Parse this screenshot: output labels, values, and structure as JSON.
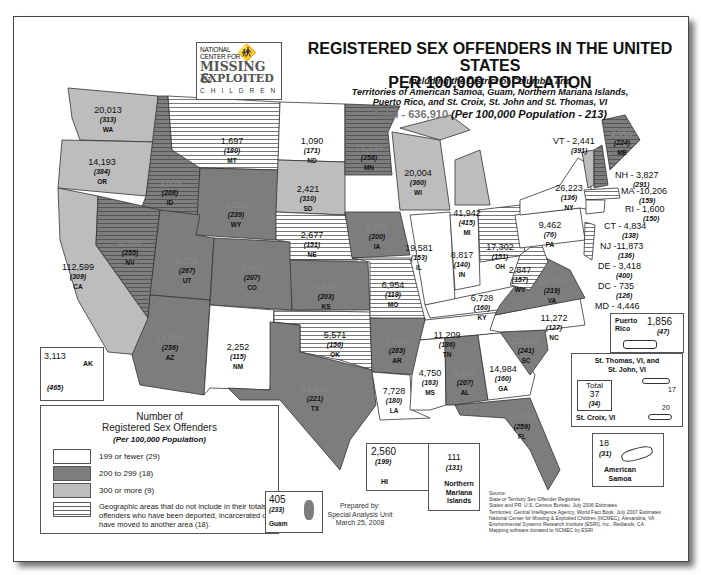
{
  "logo": {
    "line1": "NATIONAL",
    "line2": "CENTER FOR",
    "missing": "MISSING &",
    "exploited": "EXPLOITED",
    "children": "CHILDREN",
    "icon": "running-children-icon"
  },
  "header": {
    "title_line1": "REGISTERED SEX OFFENDERS IN THE UNITED STATES",
    "title_line2": "PER 100,000 POPULATION",
    "subtitle_line1": "Including the District of Columbia and",
    "subtitle_line2": "Territories of American Samoa, Guam, Northern Mariana Islands,",
    "subtitle_line3": "Puerto Rico, and St. Croix, St. John and St. Thomas, VI",
    "total_label": "Total - 636,910",
    "total_rate": "(Per 100,000 Population - 213)"
  },
  "colors": {
    "low": "#ffffff",
    "mid": "#7d7d7d",
    "high": "#bdbdbd",
    "hatch_line": "#666666",
    "border": "#444444"
  },
  "states": {
    "WA": {
      "count": "20,013",
      "rate": "(313)",
      "code": "WA"
    },
    "OR": {
      "count": "14,193",
      "rate": "(384)",
      "code": "OR"
    },
    "CA": {
      "count": "112,599",
      "rate": "(309)",
      "code": "CA"
    },
    "ID": {
      "count": "3,059",
      "rate": "(208)",
      "code": "ID"
    },
    "NV": {
      "count": "6,366",
      "rate": "(255)",
      "code": "NV"
    },
    "MT": {
      "count": "1,697",
      "rate": "(180)",
      "code": "MT"
    },
    "WY": {
      "count": "1,229",
      "rate": "(239)",
      "code": "WY"
    },
    "UT": {
      "count": "6,796",
      "rate": "(267)",
      "code": "UT"
    },
    "AZ": {
      "count": "14,559",
      "rate": "(236)",
      "code": "AZ"
    },
    "CO": {
      "count": "9,860",
      "rate": "(207)",
      "code": "CO"
    },
    "NM": {
      "count": "2,252",
      "rate": "(115)",
      "code": "NM"
    },
    "ND": {
      "count": "1,090",
      "rate": "(171)",
      "code": "ND"
    },
    "SD": {
      "count": "2,421",
      "rate": "(310)",
      "code": "SD"
    },
    "NE": {
      "count": "2,677",
      "rate": "(151)",
      "code": "NE"
    },
    "KS": {
      "count": "5,665",
      "rate": "(203)",
      "code": "KS"
    },
    "OK": {
      "count": "5,571",
      "rate": "(156)",
      "code": "OK"
    },
    "TX": {
      "count": "51,898",
      "rate": "(221)",
      "code": "TX"
    },
    "MN": {
      "count": "13,349",
      "rate": "(258)",
      "code": "MN"
    },
    "IA": {
      "count": "5,951",
      "rate": "(200)",
      "code": "IA"
    },
    "MO": {
      "count": "6,954",
      "rate": "(119)",
      "code": "MO"
    },
    "AR": {
      "count": "7,959",
      "rate": "(283)",
      "code": "AR"
    },
    "LA": {
      "count": "7,728",
      "rate": "(180)",
      "code": "LA"
    },
    "WI": {
      "count": "20,004",
      "rate": "(360)",
      "code": "WI"
    },
    "IL": {
      "count": "19,581",
      "rate": "(153)",
      "code": "IL"
    },
    "MI": {
      "count": "41,942",
      "rate": "(415)",
      "code": "MI"
    },
    "IN": {
      "count": "8,817",
      "rate": "(140)",
      "code": "IN"
    },
    "OH": {
      "count": "17,302",
      "rate": "(151)",
      "code": "OH"
    },
    "KY": {
      "count": "6,728",
      "rate": "(160)",
      "code": "KY"
    },
    "TN": {
      "count": "11,209",
      "rate": "(186)",
      "code": "TN"
    },
    "MS": {
      "count": "4,750",
      "rate": "(163)",
      "code": "MS"
    },
    "AL": {
      "count": "9,540",
      "rate": "(207)",
      "code": "AL"
    },
    "GA": {
      "count": "14,984",
      "rate": "(160)",
      "code": "GA"
    },
    "FL": {
      "count": "46,939",
      "rate": "(259)",
      "code": "FL"
    },
    "SC": {
      "count": "10,430",
      "rate": "(241)",
      "code": "SC"
    },
    "NC": {
      "count": "11,272",
      "rate": "(127)",
      "code": "NC"
    },
    "VA": {
      "count": "15,720",
      "rate": "(219)",
      "code": "VA"
    },
    "WV": {
      "count": "2,847",
      "rate": "(157)",
      "code": "WV"
    },
    "PA": {
      "count": "9,462",
      "rate": "(76)",
      "code": "PA"
    },
    "NY": {
      "count": "26,223",
      "rate": "(136)",
      "code": "NY"
    },
    "ME": {
      "count": "2,965",
      "rate": "(224)",
      "code": "ME"
    },
    "AK": {
      "count": "3,113",
      "rate": "(465)",
      "code": "AK"
    },
    "HI": {
      "count": "2,560",
      "rate": "(199)",
      "code": "HI"
    }
  },
  "northeast_callouts": [
    {
      "label": "VT - 2,441",
      "rate": "(391)"
    },
    {
      "label": "NH - 3,827",
      "rate": "(291)"
    },
    {
      "label": "MA -10,206",
      "rate": "(159)"
    },
    {
      "label": "RI - 1,600",
      "rate": "(150)"
    },
    {
      "label": "CT - 4,834",
      "rate": "(138)"
    },
    {
      "label": "NJ -11,873",
      "rate": "(136)"
    },
    {
      "label": "DE - 3,418",
      "rate": "(400)"
    },
    {
      "label": "DC - 735",
      "rate": "(126)"
    },
    {
      "label": "MD - 4,446",
      "rate": "(79)"
    }
  ],
  "small_state_codes": {
    "VT": "VT",
    "NH": "NH",
    "MA": "MA",
    "CT": "CT",
    "NJ": "NJ",
    "MD": "MD",
    "DE": "DE"
  },
  "territories": {
    "puerto_rico": {
      "name_line1": "Puerto",
      "name_line2": "Rico",
      "count": "1,856",
      "rate": "(47)"
    },
    "virgin_islands": {
      "title_line1": "St. Thomas, VI, and",
      "title_line2": "St. John, VI",
      "stthomas_count": "17",
      "stcroix_label": "St. Croix, VI",
      "stcroix_count": "20",
      "total_label": "Total",
      "total_count": "37",
      "total_rate": "(34)"
    },
    "american_samoa": {
      "count": "18",
      "rate": "(31)",
      "name_line1": "American",
      "name_line2": "Samoa"
    },
    "guam": {
      "count": "405",
      "rate": "(233)",
      "name": "Guam"
    },
    "northern_mariana": {
      "count": "111",
      "rate": "(131)",
      "name_line1": "Northern",
      "name_line2": "Mariana",
      "name_line3": "Islands"
    }
  },
  "legend": {
    "title_line1": "Number of",
    "title_line2": "Registered Sex Offenders",
    "subtitle": "(Per 100,000 Population)",
    "items": [
      {
        "swatch": "white",
        "label": "199 or fewer (29)"
      },
      {
        "swatch": "dark-gray",
        "label": "200 to 299 (18)"
      },
      {
        "swatch": "light-gray",
        "label": "300 or more (9)"
      },
      {
        "swatch": "hatched",
        "label": "Geographic areas that do not include in their totals offenders who have been deported, incarcerated or have moved to another area (18)."
      }
    ]
  },
  "prepared": {
    "line1": "Prepared by:",
    "line2": "Special Analysis Unit",
    "line3": "March 25, 2008"
  },
  "source": {
    "line1": "Source:",
    "line2": "State or Territory Sex Offender Registries",
    "line3": "States and PR: U.S. Census Bureau, July 2006 Estimates",
    "line4": "Territories:  Central Intelligence Agency, World Fact Book, July 2007 Estimates",
    "line5": "National Center for Missing & Exploited Children (NCMEC), Alexandria, VA",
    "line6": "Environmental Systems Research Institute (ESRI), Inc., Redlands, CA",
    "line7": "Mapping software donated to NCMEC by ESRI"
  }
}
